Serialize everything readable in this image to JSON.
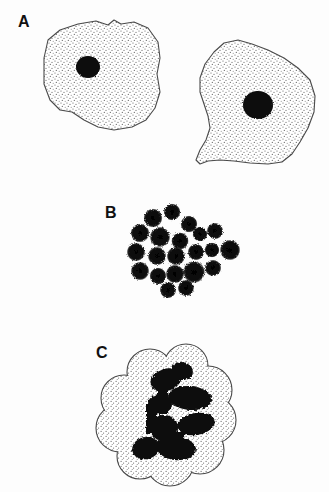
{
  "figure": {
    "width": 329,
    "height": 492,
    "background_color": "#fdfdfd",
    "ink_color": "#111111",
    "outline_color": "#4a4a4a",
    "stipple_color": "#5a5a5a",
    "type": "scientific-line-drawing"
  },
  "panels": [
    {
      "label": "A",
      "label_x": 18,
      "label_y": 14,
      "description": "Two large stippled mononuclear cells with single round dark nucleus each",
      "objects": [
        {
          "name": "cell-left",
          "outline": "44,58 48,40 60,30 78,24 96,21 108,25 114,20 121,24 134,22 148,28 158,42 160,58 157,74 160,92 155,108 146,120 132,127 114,130 98,127 84,120 72,112 60,110 50,100 44,84",
          "nucleus": {
            "cx": 88,
            "cy": 67,
            "rx": 12,
            "ry": 11
          }
        },
        {
          "name": "cell-right",
          "outline": "214,52 224,43 238,40 252,44 268,50 284,58 298,68 310,80 315,96 314,112 308,128 300,142 292,154 282,162 268,164 250,163 234,161 220,160 208,161 200,164 196,160 200,150 206,140 210,128 208,116 204,104 200,92 200,78 205,64",
          "nucleus": {
            "cx": 258,
            "cy": 105,
            "rx": 15,
            "ry": 14
          }
        }
      ]
    },
    {
      "label": "B",
      "label_x": 105,
      "label_y": 205,
      "description": "Cluster of approximately 21 small dark round cells with fuzzy stippled margins",
      "cluster_bounds": {
        "x1": 128,
        "y1": 208,
        "x2": 242,
        "y2": 297
      },
      "blobs": [
        {
          "cx": 153,
          "cy": 218,
          "r": 9
        },
        {
          "cx": 172,
          "cy": 212,
          "r": 8
        },
        {
          "cx": 189,
          "cy": 224,
          "r": 8
        },
        {
          "cx": 140,
          "cy": 233,
          "r": 9
        },
        {
          "cx": 160,
          "cy": 237,
          "r": 10
        },
        {
          "cx": 180,
          "cy": 241,
          "r": 8
        },
        {
          "cx": 200,
          "cy": 234,
          "r": 7
        },
        {
          "cx": 215,
          "cy": 231,
          "r": 8
        },
        {
          "cx": 136,
          "cy": 252,
          "r": 9
        },
        {
          "cx": 157,
          "cy": 256,
          "r": 9
        },
        {
          "cx": 176,
          "cy": 256,
          "r": 9
        },
        {
          "cx": 196,
          "cy": 252,
          "r": 8
        },
        {
          "cx": 212,
          "cy": 250,
          "r": 7
        },
        {
          "cx": 230,
          "cy": 250,
          "r": 10
        },
        {
          "cx": 140,
          "cy": 271,
          "r": 9
        },
        {
          "cx": 158,
          "cy": 276,
          "r": 8
        },
        {
          "cx": 175,
          "cy": 274,
          "r": 9
        },
        {
          "cx": 194,
          "cy": 272,
          "r": 11
        },
        {
          "cx": 213,
          "cy": 268,
          "r": 8
        },
        {
          "cx": 168,
          "cy": 290,
          "r": 8
        },
        {
          "cx": 186,
          "cy": 288,
          "r": 8
        }
      ]
    },
    {
      "label": "C",
      "label_x": 96,
      "label_y": 345,
      "description": "Single large lobed stippled cell with irregular multi-lobed dark chromatin masses",
      "cell_bounds": {
        "x1": 104,
        "y1": 352,
        "x2": 226,
        "y2": 478
      },
      "lobe_centers": [
        {
          "cx": 150,
          "cy": 372,
          "r": 23
        },
        {
          "cx": 186,
          "cy": 366,
          "r": 22
        },
        {
          "cx": 208,
          "cy": 390,
          "r": 24
        },
        {
          "cx": 212,
          "cy": 420,
          "r": 24
        },
        {
          "cx": 200,
          "cy": 450,
          "r": 24
        },
        {
          "cx": 170,
          "cy": 462,
          "r": 24
        },
        {
          "cx": 140,
          "cy": 456,
          "r": 23
        },
        {
          "cx": 120,
          "cy": 428,
          "r": 24
        },
        {
          "cx": 124,
          "cy": 398,
          "r": 23
        }
      ],
      "chromatin_masses": [
        {
          "cx": 166,
          "cy": 380,
          "rx": 16,
          "ry": 11,
          "rot": -20
        },
        {
          "cx": 182,
          "cy": 372,
          "rx": 11,
          "ry": 9,
          "rot": 10
        },
        {
          "cx": 190,
          "cy": 398,
          "rx": 22,
          "ry": 12,
          "rot": 5
        },
        {
          "cx": 160,
          "cy": 404,
          "rx": 12,
          "ry": 10,
          "rot": 0
        },
        {
          "cx": 196,
          "cy": 424,
          "rx": 19,
          "ry": 11,
          "rot": -10
        },
        {
          "cx": 164,
          "cy": 428,
          "rx": 14,
          "ry": 13,
          "rot": 0
        },
        {
          "cx": 176,
          "cy": 448,
          "rx": 20,
          "ry": 12,
          "rot": 8
        },
        {
          "cx": 146,
          "cy": 448,
          "rx": 14,
          "ry": 11,
          "rot": -15
        },
        {
          "cx": 152,
          "cy": 418,
          "rx": 9,
          "ry": 14,
          "rot": 0
        }
      ]
    }
  ]
}
